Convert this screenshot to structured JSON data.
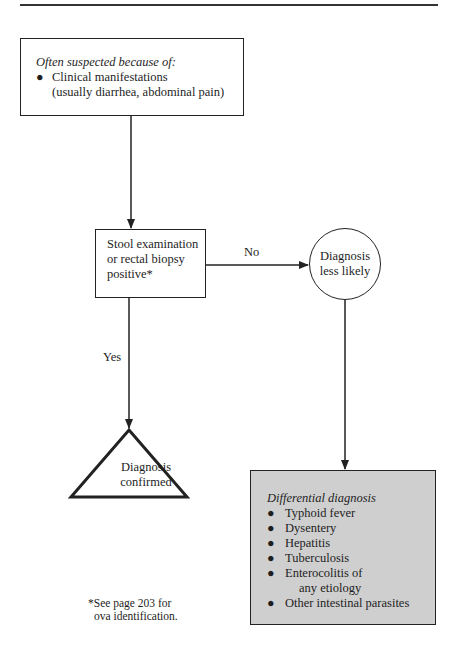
{
  "diagram": {
    "start_box": {
      "title": "Often suspected because of:",
      "items": [
        {
          "bullet": "●",
          "line1": "Clinical manifestations",
          "line2": "(usually diarrhea, abdominal pain)"
        }
      ]
    },
    "decision_box": {
      "lines": [
        "Stool examination",
        "or rectal biopsy",
        "positive*"
      ]
    },
    "edges": {
      "no_label": "No",
      "yes_label": "Yes"
    },
    "less_likely_circle": {
      "lines": [
        "Diagnosis",
        "less likely"
      ]
    },
    "confirmed_triangle": {
      "lines": [
        "Diagnosis",
        "confirmed"
      ]
    },
    "differential_box": {
      "title": "Differential diagnosis",
      "bullet": "●",
      "items": [
        {
          "text": "Typhoid fever"
        },
        {
          "text": "Dysentery"
        },
        {
          "text": "Hepatitis"
        },
        {
          "text": "Tuberculosis"
        },
        {
          "text": "Enterocolitis of",
          "cont": "any etiology"
        },
        {
          "text": "Other intestinal parasites"
        }
      ],
      "fill_color": "#cfcfcf"
    },
    "footnote": {
      "line1": "*See page 203 for",
      "line2": "ova identification."
    }
  }
}
